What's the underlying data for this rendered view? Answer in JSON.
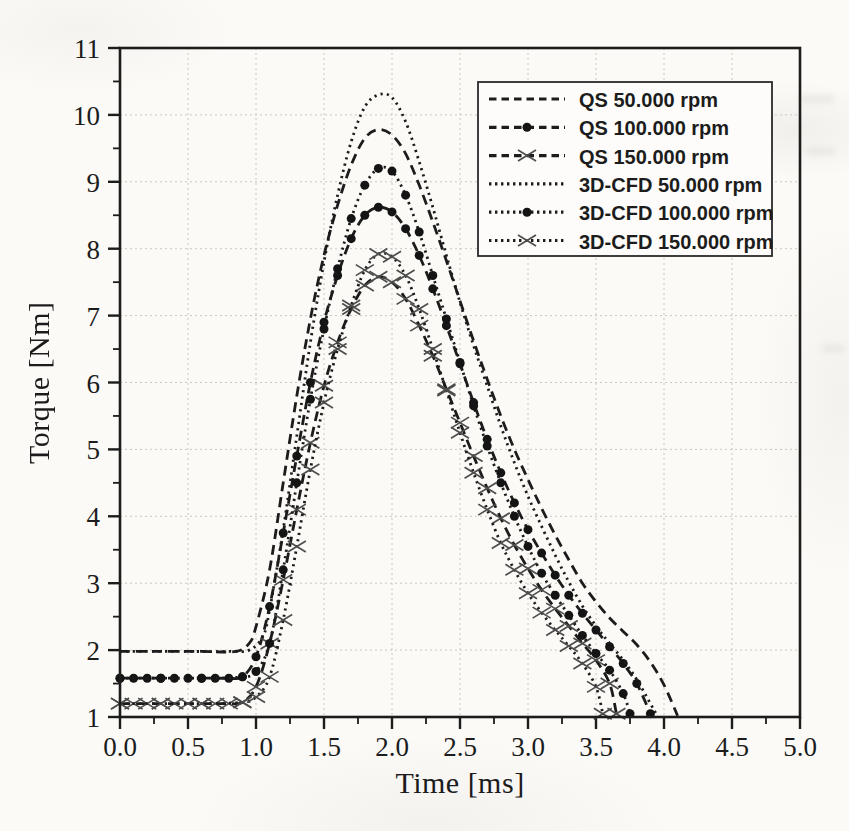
{
  "chart_data": {
    "type": "line",
    "title": "",
    "xlabel": "Time [ms]",
    "ylabel": "Torque [Nm]",
    "xlim": [
      0.0,
      5.0
    ],
    "ylim": [
      1,
      11
    ],
    "x_tick_labels": [
      "0.0",
      "0.5",
      "1.0",
      "1.5",
      "2.0",
      "2.5",
      "3.0",
      "3.5",
      "4.0",
      "4.5",
      "5.0"
    ],
    "y_tick_labels": [
      "1",
      "2",
      "3",
      "4",
      "5",
      "6",
      "7",
      "8",
      "9",
      "10",
      "11"
    ],
    "x_major_step": 0.5,
    "x_minor_step": 0.25,
    "y_major_step": 1,
    "y_minor_step": 0.5,
    "grid": true,
    "legend_position": "upper-right",
    "colors": {
      "ink": "#1c1c1c",
      "grid": "#c8c8c2",
      "marker_x": "#4d4d4d",
      "marker_circle": "#141414",
      "legend_border": "#2a2a2a",
      "paper": "#fbfaf7"
    },
    "series": [
      {
        "name": "QS 50.000 rpm",
        "line": "dashed",
        "marker": "none",
        "points": [
          [
            0,
            1.98
          ],
          [
            0.3,
            1.98
          ],
          [
            0.6,
            1.98
          ],
          [
            0.85,
            1.98
          ],
          [
            0.95,
            2.1
          ],
          [
            1.0,
            2.35
          ],
          [
            1.1,
            3.2
          ],
          [
            1.2,
            4.5
          ],
          [
            1.3,
            5.8
          ],
          [
            1.4,
            6.95
          ],
          [
            1.5,
            7.9
          ],
          [
            1.6,
            8.65
          ],
          [
            1.7,
            9.25
          ],
          [
            1.8,
            9.65
          ],
          [
            1.9,
            9.78
          ],
          [
            2.0,
            9.7
          ],
          [
            2.1,
            9.42
          ],
          [
            2.2,
            8.95
          ],
          [
            2.3,
            8.4
          ],
          [
            2.4,
            7.82
          ],
          [
            2.5,
            7.22
          ],
          [
            2.6,
            6.62
          ],
          [
            2.7,
            6.05
          ],
          [
            2.8,
            5.5
          ],
          [
            2.9,
            5.0
          ],
          [
            3.0,
            4.55
          ],
          [
            3.1,
            4.12
          ],
          [
            3.2,
            3.72
          ],
          [
            3.3,
            3.35
          ],
          [
            3.4,
            3.0
          ],
          [
            3.5,
            2.72
          ],
          [
            3.6,
            2.48
          ],
          [
            3.7,
            2.28
          ],
          [
            3.8,
            2.08
          ],
          [
            3.9,
            1.82
          ],
          [
            4.0,
            1.48
          ],
          [
            4.1,
            1.02
          ]
        ]
      },
      {
        "name": "QS 100.000 rpm",
        "line": "dashed",
        "marker": "circle",
        "points": [
          [
            0,
            1.58
          ],
          [
            0.1,
            1.58
          ],
          [
            0.2,
            1.58
          ],
          [
            0.3,
            1.58
          ],
          [
            0.4,
            1.58
          ],
          [
            0.5,
            1.58
          ],
          [
            0.6,
            1.58
          ],
          [
            0.7,
            1.58
          ],
          [
            0.8,
            1.58
          ],
          [
            0.9,
            1.6
          ],
          [
            1.0,
            1.9
          ],
          [
            1.1,
            2.65
          ],
          [
            1.2,
            3.75
          ],
          [
            1.3,
            4.9
          ],
          [
            1.4,
            6.0
          ],
          [
            1.5,
            6.9
          ],
          [
            1.6,
            7.6
          ],
          [
            1.7,
            8.15
          ],
          [
            1.8,
            8.5
          ],
          [
            1.9,
            8.62
          ],
          [
            2.0,
            8.55
          ],
          [
            2.1,
            8.3
          ],
          [
            2.2,
            7.9
          ],
          [
            2.3,
            7.4
          ],
          [
            2.4,
            6.85
          ],
          [
            2.5,
            6.28
          ],
          [
            2.6,
            5.7
          ],
          [
            2.7,
            5.15
          ],
          [
            2.8,
            4.65
          ],
          [
            2.9,
            4.2
          ],
          [
            3.0,
            3.8
          ],
          [
            3.1,
            3.45
          ],
          [
            3.2,
            3.12
          ],
          [
            3.3,
            2.82
          ],
          [
            3.4,
            2.55
          ],
          [
            3.5,
            2.3
          ],
          [
            3.6,
            2.05
          ],
          [
            3.7,
            1.8
          ],
          [
            3.8,
            1.5
          ],
          [
            3.9,
            1.05
          ]
        ]
      },
      {
        "name": "QS 150.000 rpm",
        "line": "dashed",
        "marker": "x",
        "points": [
          [
            0,
            1.2
          ],
          [
            0.1,
            1.2
          ],
          [
            0.2,
            1.2
          ],
          [
            0.3,
            1.2
          ],
          [
            0.4,
            1.2
          ],
          [
            0.5,
            1.2
          ],
          [
            0.6,
            1.2
          ],
          [
            0.7,
            1.2
          ],
          [
            0.8,
            1.2
          ],
          [
            0.9,
            1.22
          ],
          [
            1.0,
            1.45
          ],
          [
            1.1,
            2.1
          ],
          [
            1.2,
            3.05
          ],
          [
            1.3,
            4.1
          ],
          [
            1.4,
            5.1
          ],
          [
            1.5,
            5.95
          ],
          [
            1.6,
            6.6
          ],
          [
            1.7,
            7.1
          ],
          [
            1.8,
            7.45
          ],
          [
            1.9,
            7.58
          ],
          [
            2.0,
            7.5
          ],
          [
            2.1,
            7.25
          ],
          [
            2.2,
            6.85
          ],
          [
            2.3,
            6.4
          ],
          [
            2.4,
            5.9
          ],
          [
            2.5,
            5.4
          ],
          [
            2.6,
            4.9
          ],
          [
            2.7,
            4.42
          ],
          [
            2.8,
            3.97
          ],
          [
            2.9,
            3.57
          ],
          [
            3.0,
            3.22
          ],
          [
            3.1,
            2.9
          ],
          [
            3.2,
            2.62
          ],
          [
            3.3,
            2.36
          ],
          [
            3.4,
            2.1
          ],
          [
            3.5,
            1.85
          ],
          [
            3.6,
            1.5
          ],
          [
            3.65,
            1.05
          ]
        ]
      },
      {
        "name": "3D-CFD 50.000 rpm",
        "line": "dotted",
        "marker": "none",
        "points": [
          [
            0,
            1.98
          ],
          [
            0.4,
            1.98
          ],
          [
            0.8,
            1.98
          ],
          [
            0.95,
            2.0
          ],
          [
            1.05,
            2.2
          ],
          [
            1.1,
            2.6
          ],
          [
            1.2,
            3.8
          ],
          [
            1.3,
            5.2
          ],
          [
            1.4,
            6.6
          ],
          [
            1.5,
            7.8
          ],
          [
            1.6,
            8.8
          ],
          [
            1.7,
            9.6
          ],
          [
            1.8,
            10.12
          ],
          [
            1.9,
            10.3
          ],
          [
            2.0,
            10.26
          ],
          [
            2.1,
            9.9
          ],
          [
            2.2,
            9.3
          ],
          [
            2.3,
            8.62
          ],
          [
            2.4,
            7.9
          ],
          [
            2.5,
            7.2
          ],
          [
            2.6,
            6.55
          ],
          [
            2.7,
            5.95
          ],
          [
            2.8,
            5.35
          ],
          [
            2.9,
            4.8
          ],
          [
            3.0,
            4.3
          ],
          [
            3.1,
            3.85
          ],
          [
            3.2,
            3.42
          ],
          [
            3.3,
            3.02
          ],
          [
            3.4,
            2.66
          ],
          [
            3.5,
            2.36
          ],
          [
            3.6,
            2.1
          ],
          [
            3.7,
            1.85
          ],
          [
            3.8,
            1.56
          ],
          [
            3.9,
            1.2
          ],
          [
            3.95,
            1.02
          ]
        ]
      },
      {
        "name": "3D-CFD 100.000 rpm",
        "line": "dotted",
        "marker": "circle",
        "points": [
          [
            0,
            1.58
          ],
          [
            0.3,
            1.58
          ],
          [
            0.6,
            1.58
          ],
          [
            0.9,
            1.6
          ],
          [
            1.0,
            1.68
          ],
          [
            1.1,
            2.1
          ],
          [
            1.2,
            3.2
          ],
          [
            1.3,
            4.5
          ],
          [
            1.4,
            5.75
          ],
          [
            1.5,
            6.8
          ],
          [
            1.6,
            7.7
          ],
          [
            1.7,
            8.45
          ],
          [
            1.8,
            8.95
          ],
          [
            1.9,
            9.2
          ],
          [
            2.0,
            9.16
          ],
          [
            2.1,
            8.8
          ],
          [
            2.2,
            8.25
          ],
          [
            2.3,
            7.6
          ],
          [
            2.4,
            6.95
          ],
          [
            2.5,
            6.3
          ],
          [
            2.6,
            5.65
          ],
          [
            2.7,
            5.05
          ],
          [
            2.8,
            4.5
          ],
          [
            2.9,
            4.0
          ],
          [
            3.0,
            3.55
          ],
          [
            3.1,
            3.15
          ],
          [
            3.2,
            2.82
          ],
          [
            3.3,
            2.52
          ],
          [
            3.4,
            2.22
          ],
          [
            3.5,
            1.95
          ],
          [
            3.6,
            1.7
          ],
          [
            3.7,
            1.35
          ],
          [
            3.75,
            1.05
          ]
        ]
      },
      {
        "name": "3D-CFD 150.000 rpm",
        "line": "dotted",
        "marker": "x",
        "points": [
          [
            0,
            1.2
          ],
          [
            0.3,
            1.2
          ],
          [
            0.6,
            1.2
          ],
          [
            0.9,
            1.22
          ],
          [
            1.0,
            1.3
          ],
          [
            1.1,
            1.6
          ],
          [
            1.2,
            2.45
          ],
          [
            1.3,
            3.55
          ],
          [
            1.4,
            4.7
          ],
          [
            1.5,
            5.7
          ],
          [
            1.6,
            6.5
          ],
          [
            1.7,
            7.15
          ],
          [
            1.8,
            7.68
          ],
          [
            1.9,
            7.92
          ],
          [
            2.0,
            7.88
          ],
          [
            2.1,
            7.6
          ],
          [
            2.2,
            7.1
          ],
          [
            2.3,
            6.5
          ],
          [
            2.4,
            5.88
          ],
          [
            2.5,
            5.25
          ],
          [
            2.6,
            4.65
          ],
          [
            2.7,
            4.1
          ],
          [
            2.8,
            3.6
          ],
          [
            2.9,
            3.2
          ],
          [
            3.0,
            2.85
          ],
          [
            3.1,
            2.56
          ],
          [
            3.2,
            2.3
          ],
          [
            3.3,
            2.06
          ],
          [
            3.4,
            1.8
          ],
          [
            3.5,
            1.45
          ],
          [
            3.55,
            1.05
          ]
        ]
      }
    ]
  }
}
